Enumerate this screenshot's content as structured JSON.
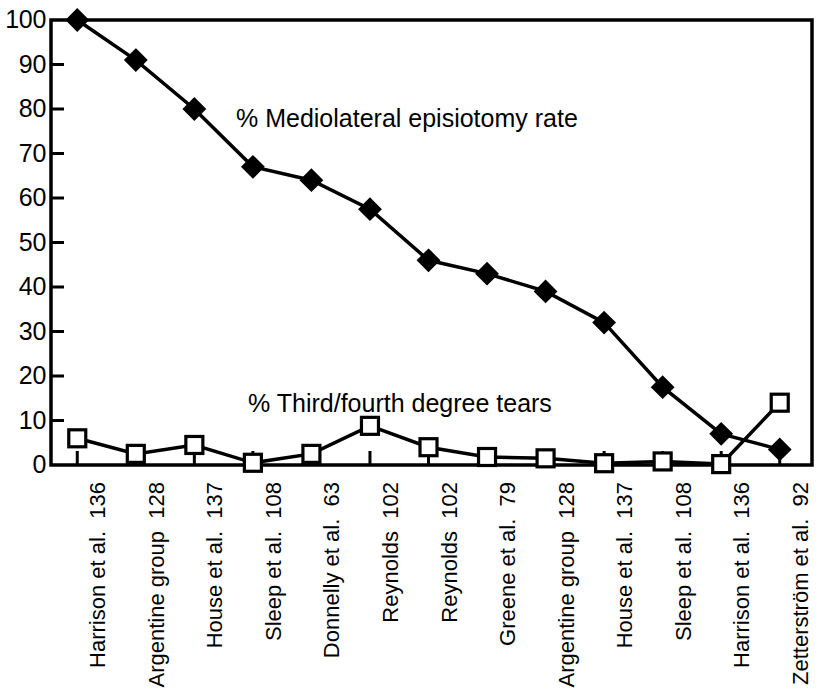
{
  "chart_data": {
    "type": "line",
    "title": "",
    "subtitle": "",
    "xlabel": "",
    "ylabel": "",
    "ylim": [
      0,
      100
    ],
    "yticks": [
      0,
      10,
      20,
      30,
      40,
      50,
      60,
      70,
      80,
      90,
      100
    ],
    "grid": false,
    "legend_position": "inline-annotation",
    "frame": "box",
    "categories": [
      "Harrison et al. 136",
      "Argentine group 128",
      "House et al. 137",
      "Sleep et al. 108",
      "Donnelly et al. 63",
      "Reynolds 102",
      "Reynolds 102",
      "Greene et al. 79",
      "Argentine group 128",
      "House et al. 137",
      "Sleep et al. 108",
      "Harrison et al. 136",
      "Zetterström et al. 92"
    ],
    "category_parts": [
      {
        "name": "Harrison et al.",
        "ref": "136"
      },
      {
        "name": "Argentine group",
        "ref": "128"
      },
      {
        "name": "House et al.",
        "ref": "137"
      },
      {
        "name": "Sleep et al.",
        "ref": "108"
      },
      {
        "name": "Donnelly et al.",
        "ref": "63"
      },
      {
        "name": "Reynolds",
        "ref": "102"
      },
      {
        "name": "Reynolds",
        "ref": "102"
      },
      {
        "name": "Greene et al.",
        "ref": "79"
      },
      {
        "name": "Argentine group",
        "ref": "128"
      },
      {
        "name": "House et al.",
        "ref": "137"
      },
      {
        "name": "Sleep et al.",
        "ref": "108"
      },
      {
        "name": "Harrison et al.",
        "ref": "136"
      },
      {
        "name": "Zetterström et al.",
        "ref": "92"
      }
    ],
    "series": [
      {
        "name": "% Mediolateral episiotomy rate",
        "marker": "filled-diamond",
        "color": "#000000",
        "values": [
          100,
          91,
          80,
          67,
          64,
          57.5,
          46,
          43,
          39,
          32,
          17.5,
          7,
          3.5
        ]
      },
      {
        "name": "% Third/fourth degree tears",
        "marker": "open-square",
        "color": "#000000",
        "values": [
          6,
          2.5,
          4.5,
          0.5,
          2.5,
          8.8,
          4,
          1.8,
          1.5,
          0.4,
          0.8,
          0.2,
          14
        ]
      }
    ],
    "annotations": [
      {
        "text": "% Mediolateral episiotomy rate"
      },
      {
        "text": "% Third/fourth degree tears"
      }
    ]
  }
}
